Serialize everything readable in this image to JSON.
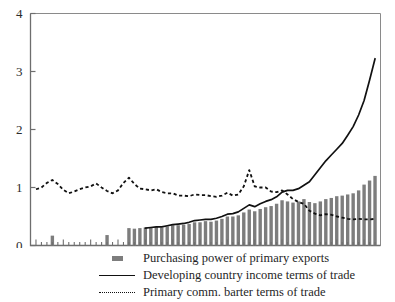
{
  "chart_data": {
    "type": "bar",
    "title": "",
    "xlabel": "",
    "ylabel": "",
    "xlim": [
      34,
      98
    ],
    "ylim": [
      0,
      4
    ],
    "yticks": [
      0,
      1,
      2,
      3,
      4
    ],
    "ytick_labels": [
      "0",
      "1",
      "2",
      "3",
      "4"
    ],
    "xticks": [
      35,
      40,
      45,
      50,
      55,
      60,
      65,
      70,
      75,
      80,
      85,
      90,
      95
    ],
    "xtick_labels": [
      "35",
      "40",
      "45",
      "50",
      "55",
      "60",
      "65",
      "70",
      "75",
      "80",
      "85",
      "90",
      "95"
    ],
    "grid": false,
    "legend_position": "below",
    "series": [
      {
        "name": "Purchasing power of primary exports",
        "type": "bar",
        "color": "#7d7d7d",
        "x": [
          38,
          48,
          52,
          53,
          54,
          55,
          56,
          57,
          58,
          59,
          60,
          61,
          62,
          63,
          64,
          65,
          66,
          67,
          68,
          69,
          70,
          71,
          72,
          73,
          74,
          75,
          76,
          77,
          78,
          79,
          80,
          81,
          82,
          83,
          84,
          85,
          86,
          87,
          88,
          89,
          90,
          91,
          92,
          93,
          94,
          95,
          96,
          97
        ],
        "values": [
          0.17,
          0.18,
          0.3,
          0.29,
          0.3,
          0.31,
          0.31,
          0.32,
          0.31,
          0.33,
          0.35,
          0.35,
          0.36,
          0.37,
          0.4,
          0.4,
          0.42,
          0.41,
          0.43,
          0.46,
          0.5,
          0.5,
          0.52,
          0.57,
          0.62,
          0.59,
          0.63,
          0.66,
          0.68,
          0.72,
          0.78,
          0.76,
          0.74,
          0.76,
          0.8,
          0.75,
          0.73,
          0.76,
          0.8,
          0.82,
          0.85,
          0.86,
          0.88,
          0.9,
          0.95,
          1.05,
          1.12,
          1.2
        ]
      },
      {
        "name": "Developing country income terms of trade",
        "type": "line",
        "color": "#111111",
        "style": "solid",
        "x": [
          55,
          56,
          57,
          58,
          59,
          60,
          61,
          62,
          63,
          64,
          65,
          66,
          67,
          68,
          69,
          70,
          71,
          72,
          73,
          74,
          75,
          76,
          77,
          78,
          79,
          80,
          81,
          82,
          83,
          84,
          85,
          86,
          87,
          88,
          89,
          90,
          91,
          92,
          93,
          94,
          95,
          96,
          97
        ],
        "values": [
          0.3,
          0.31,
          0.32,
          0.32,
          0.34,
          0.36,
          0.37,
          0.38,
          0.4,
          0.43,
          0.44,
          0.45,
          0.45,
          0.47,
          0.5,
          0.54,
          0.55,
          0.58,
          0.64,
          0.7,
          0.67,
          0.72,
          0.76,
          0.79,
          0.84,
          0.92,
          0.95,
          0.95,
          0.98,
          1.04,
          1.1,
          1.22,
          1.34,
          1.46,
          1.56,
          1.66,
          1.76,
          1.9,
          2.05,
          2.25,
          2.5,
          2.85,
          3.22
        ]
      },
      {
        "name": "Primary comm. barter terms of trade",
        "type": "line",
        "color": "#111111",
        "style": "dotted",
        "x": [
          35,
          36,
          37,
          38,
          39,
          40,
          41,
          42,
          43,
          44,
          45,
          46,
          47,
          48,
          49,
          50,
          51,
          52,
          53,
          54,
          55,
          56,
          57,
          58,
          59,
          60,
          61,
          62,
          63,
          64,
          65,
          66,
          67,
          68,
          69,
          70,
          71,
          72,
          73,
          74,
          75,
          76,
          77,
          78,
          79,
          80,
          81,
          82,
          83,
          84,
          85,
          86,
          87,
          88,
          89,
          90,
          91,
          92,
          93,
          94,
          95,
          96,
          97
        ],
        "values": [
          0.97,
          1.0,
          1.08,
          1.13,
          1.06,
          0.96,
          0.9,
          0.93,
          0.97,
          1.0,
          1.02,
          1.07,
          1.0,
          0.94,
          0.9,
          0.95,
          1.08,
          1.17,
          1.06,
          0.98,
          0.97,
          0.95,
          0.97,
          0.92,
          0.9,
          0.9,
          0.86,
          0.86,
          0.85,
          0.88,
          0.87,
          0.87,
          0.85,
          0.84,
          0.86,
          0.91,
          0.86,
          0.88,
          1.02,
          1.3,
          1.02,
          1.0,
          1.0,
          0.93,
          0.92,
          0.95,
          0.88,
          0.8,
          0.75,
          0.72,
          0.6,
          0.55,
          0.52,
          0.54,
          0.53,
          0.5,
          0.48,
          0.46,
          0.45,
          0.46,
          0.45,
          0.45,
          0.46
        ]
      }
    ]
  },
  "legend": {
    "items": [
      {
        "marker": "bar-swatch",
        "label": "Purchasing power of primary exports"
      },
      {
        "marker": "solid-line",
        "label": "Developing country income terms of trade"
      },
      {
        "marker": "dotted-line",
        "label": "Primary comm. barter terms of trade"
      }
    ]
  }
}
